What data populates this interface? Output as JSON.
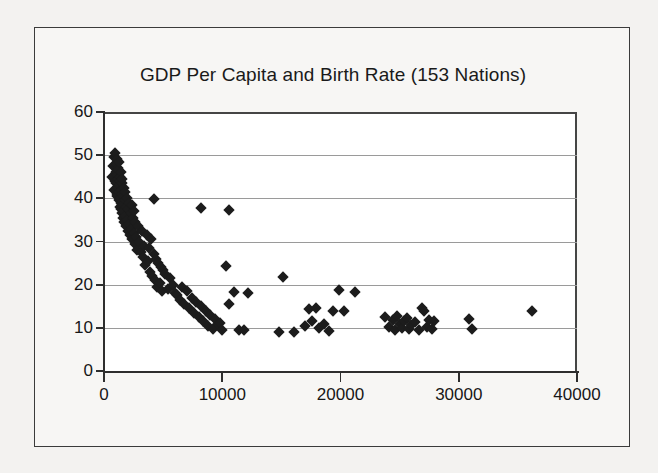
{
  "figure": {
    "background_color": "#f3f2f0",
    "panel_color": "#ffffff",
    "frame_color": "#3b3b3b",
    "marker_color": "#1c1c1c",
    "gridline_color": "#9a9a9a",
    "axis_color": "#2e2e2e"
  },
  "chart_data": {
    "type": "scatter",
    "title": "GDP Per Capita and Birth Rate (153 Nations)",
    "subtitle": "",
    "xlabel": "",
    "ylabel": "",
    "xlim": [
      0,
      40000
    ],
    "ylim": [
      0,
      60
    ],
    "xticks": [
      0,
      10000,
      20000,
      30000,
      40000
    ],
    "yticks": [
      0,
      10,
      20,
      30,
      40,
      50,
      60
    ],
    "xticklabels": [
      "0",
      "10000",
      "20000",
      "30000",
      "40000"
    ],
    "yticklabels": [
      "0",
      "10",
      "20",
      "30",
      "40",
      "50",
      "60"
    ],
    "grid": "horizontal",
    "legend": "none",
    "n_points_stated": 153,
    "marker": "diamond",
    "series": [
      {
        "name": "Nations",
        "x": [
          700,
          760,
          820,
          880,
          900,
          940,
          980,
          1000,
          1020,
          1060,
          1080,
          1100,
          1120,
          1150,
          1180,
          1200,
          1220,
          1240,
          1260,
          1280,
          1300,
          1320,
          1340,
          1360,
          1380,
          1400,
          1420,
          1440,
          1460,
          1480,
          1500,
          1520,
          1540,
          1560,
          1580,
          1600,
          1640,
          1680,
          1700,
          1740,
          1780,
          1800,
          1840,
          1880,
          1920,
          1960,
          2000,
          2050,
          2100,
          2150,
          2200,
          2250,
          2300,
          2350,
          2400,
          2450,
          2500,
          2550,
          2600,
          2650,
          2700,
          2800,
          2900,
          3000,
          3100,
          3200,
          3300,
          3400,
          3500,
          3600,
          3700,
          3800,
          3900,
          4000,
          4100,
          4200,
          4300,
          4400,
          4500,
          4600,
          4700,
          4800,
          4900,
          5000,
          5200,
          5400,
          5600,
          5800,
          6000,
          6200,
          6400,
          6600,
          6800,
          7000,
          7200,
          7400,
          7600,
          7800,
          8000,
          8200,
          8400,
          8600,
          8800,
          9000,
          9200,
          9400,
          9600,
          9800,
          10000,
          10300,
          10600,
          11000,
          11400,
          11800,
          12200,
          14800,
          15100,
          16100,
          17000,
          17300,
          17600,
          17900,
          18200,
          18600,
          19000,
          19400,
          19900,
          20300,
          21200,
          23800,
          24100,
          24400,
          24600,
          24800,
          25000,
          25200,
          25400,
          25600,
          25800,
          26000,
          26300,
          26600,
          26900,
          27100,
          27300,
          27500,
          27700,
          27900,
          30900,
          31100,
          36200,
          4200,
          8200,
          10600
        ],
        "y": [
          45.0,
          47.5,
          42.0,
          49.5,
          44.0,
          50.5,
          46.0,
          43.5,
          48.0,
          41.0,
          45.5,
          49.0,
          40.5,
          47.0,
          44.5,
          42.5,
          46.5,
          39.5,
          48.5,
          43.0,
          41.5,
          45.0,
          38.0,
          44.0,
          40.0,
          46.0,
          37.5,
          42.0,
          39.0,
          43.5,
          36.5,
          41.0,
          38.5,
          44.5,
          35.5,
          40.5,
          37.0,
          42.5,
          34.5,
          39.5,
          36.0,
          41.5,
          33.5,
          38.0,
          35.0,
          40.0,
          32.5,
          37.5,
          34.0,
          39.0,
          31.5,
          36.5,
          33.0,
          38.5,
          30.5,
          35.5,
          32.0,
          37.0,
          29.5,
          34.5,
          31.0,
          28.0,
          33.5,
          30.0,
          27.5,
          32.5,
          26.5,
          29.0,
          24.5,
          31.5,
          25.5,
          28.5,
          23.0,
          30.5,
          22.0,
          27.0,
          21.0,
          26.0,
          19.5,
          25.0,
          20.5,
          24.0,
          18.5,
          23.5,
          22.5,
          19.0,
          21.5,
          20.0,
          18.0,
          17.5,
          16.5,
          19.5,
          15.5,
          18.5,
          14.5,
          17.0,
          13.5,
          16.0,
          12.5,
          15.0,
          11.5,
          14.0,
          10.5,
          13.0,
          9.8,
          12.0,
          10.8,
          11.2,
          9.5,
          24.3,
          15.5,
          18.2,
          9.5,
          9.6,
          18.0,
          9.0,
          21.8,
          9.1,
          10.5,
          14.3,
          11.5,
          14.5,
          9.9,
          10.9,
          9.2,
          14.0,
          18.8,
          13.9,
          18.2,
          12.4,
          10.2,
          11.8,
          9.6,
          12.8,
          11.0,
          10.0,
          11.6,
          12.2,
          9.8,
          10.6,
          11.4,
          9.4,
          14.5,
          13.8,
          10.3,
          11.9,
          9.7,
          11.5,
          12.0,
          9.7,
          14.0,
          39.8,
          37.8,
          37.2
        ]
      }
    ]
  }
}
